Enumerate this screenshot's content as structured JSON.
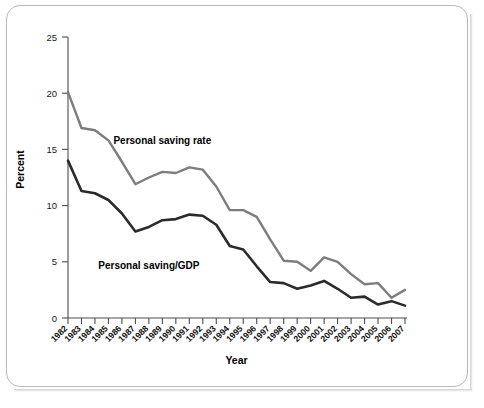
{
  "chart_data": {
    "type": "line",
    "title": "",
    "xlabel": "Year",
    "ylabel": "Percent",
    "ylim": [
      0,
      25
    ],
    "yticks": [
      0,
      5,
      10,
      15,
      20,
      25
    ],
    "grid": false,
    "legend_position": "inline-annotations",
    "categories": [
      "1982",
      "1983",
      "1984",
      "1985",
      "1986",
      "1987",
      "1988",
      "1989",
      "1990",
      "1991",
      "1992",
      "1993",
      "1994",
      "1995",
      "1996",
      "1997",
      "1998",
      "1999",
      "2000",
      "2001",
      "2002",
      "2003",
      "2004",
      "2005",
      "2006",
      "2007"
    ],
    "series": [
      {
        "name": "Personal saving rate",
        "color": "#7d7d7d",
        "values": [
          20.1,
          16.9,
          16.7,
          15.8,
          13.9,
          11.9,
          12.5,
          13.0,
          12.9,
          13.4,
          13.2,
          11.7,
          9.6,
          9.6,
          9.0,
          7.0,
          5.1,
          5.0,
          4.2,
          5.4,
          5.0,
          3.9,
          3.0,
          3.1,
          1.8,
          2.5
        ]
      },
      {
        "name": "Personal saving/GDP",
        "color": "#2b2b2b",
        "values": [
          14.0,
          11.3,
          11.1,
          10.5,
          9.3,
          7.7,
          8.1,
          8.7,
          8.8,
          9.2,
          9.1,
          8.3,
          6.4,
          6.1,
          4.6,
          3.2,
          3.1,
          2.6,
          2.9,
          3.3,
          2.6,
          1.8,
          1.9,
          1.2,
          1.5,
          1.1
        ]
      }
    ],
    "annotations": [
      {
        "text": "Personal saving rate",
        "x_year": "1989",
        "y_value": 15.5
      },
      {
        "text": "Personal saving/GDP",
        "x_year": "1988",
        "y_value": 4.4
      }
    ]
  },
  "axis": {
    "y_title": "Percent",
    "x_title": "Year",
    "y_tick_labels": [
      "0",
      "5",
      "10",
      "15",
      "20",
      "25"
    ]
  },
  "colors": {
    "saving_rate_line": "#7d7d7d",
    "saving_gdp_line": "#2b2b2b",
    "axis": "#4d4d4d",
    "frame_border": "#b9b9b9",
    "background": "#ffffff"
  }
}
